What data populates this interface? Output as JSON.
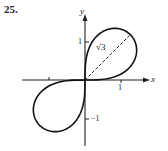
{
  "problem_number": "25.",
  "chart_data": {
    "type": "line",
    "title": "",
    "curve": "polar lemniscate r^2 = 3 sin(2θ)",
    "xlabel": "x",
    "ylabel": "y",
    "xlim": [
      -1.7,
      1.7
    ],
    "ylim": [
      -1.7,
      1.9
    ],
    "x_ticks": [
      {
        "value": -1,
        "label": ""
      },
      {
        "value": 1,
        "label": "1"
      }
    ],
    "y_ticks": [
      {
        "value": 1,
        "label": "1"
      },
      {
        "value": -1,
        "label": "−1"
      }
    ],
    "annotations": [
      {
        "text": "√3",
        "type": "dashed-segment",
        "from": [
          0,
          0
        ],
        "to": [
          1.22,
          1.22
        ],
        "angle_deg": 45
      }
    ],
    "grid": false,
    "series": [
      {
        "name": "lemniscate",
        "max_r": 1.732,
        "loops": [
          "first-quadrant",
          "third-quadrant"
        ]
      }
    ]
  },
  "labels": {
    "x_axis": "x",
    "y_axis": "y",
    "x_tick_1": "1",
    "y_tick_1": "1",
    "y_tick_neg1": "−1",
    "sqrt3": "√3"
  }
}
